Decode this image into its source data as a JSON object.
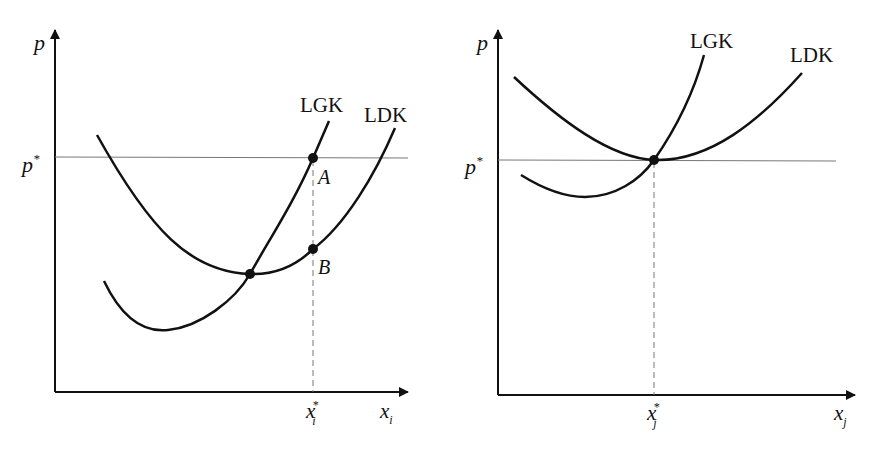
{
  "figure": {
    "panels": [
      {
        "id": "left",
        "axis_y_label": "p",
        "axis_x_label": "x",
        "axis_x_subscript": "i",
        "price_level_label": "p",
        "price_level_superscript": "*",
        "quantity_label": "x",
        "quantity_superscript": "*",
        "quantity_subscript": "i",
        "curves": [
          {
            "name": "LGK",
            "label": "LGK"
          },
          {
            "name": "LDK",
            "label": "LDK"
          }
        ],
        "points": [
          {
            "label": "A"
          },
          {
            "label": "B"
          }
        ]
      },
      {
        "id": "right",
        "axis_y_label": "p",
        "axis_x_label": "x",
        "axis_x_subscript": "j",
        "price_level_label": "p",
        "price_level_superscript": "*",
        "quantity_label": "x",
        "quantity_superscript": "*",
        "quantity_subscript": "j",
        "curves": [
          {
            "name": "LGK",
            "label": "LGK"
          },
          {
            "name": "LDK",
            "label": "LDK"
          }
        ]
      }
    ],
    "colors": {
      "ink": "#111111",
      "guide": "#777777"
    }
  }
}
